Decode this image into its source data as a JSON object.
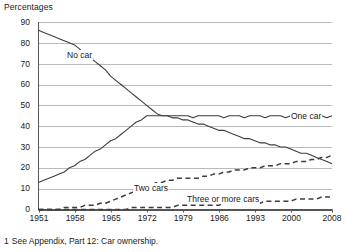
{
  "axis_title": "Percentages",
  "footnote": {
    "number": "1",
    "text": "See Appendix, Part 12: Car ownership."
  },
  "labels": {
    "no_car": "No car",
    "one_car": "One car",
    "two_cars": "Two cars",
    "three_or_more_cars": "Three or more cars"
  },
  "colors": {
    "line": "#3c3c3c",
    "grid": "#b9b9b9",
    "axis": "#555555",
    "text": "#1a1a1a",
    "background": "#ffffff"
  },
  "chart_data": {
    "type": "line",
    "title": "",
    "subtitle": "",
    "xlabel": "",
    "ylabel": "Percentages",
    "ylim": [
      0,
      90
    ],
    "xlim": [
      1951,
      2008
    ],
    "grid": true,
    "legend": "inline-labels",
    "ytick_labels": [
      "0",
      "10",
      "20",
      "30",
      "40",
      "50",
      "60",
      "70",
      "80",
      "90"
    ],
    "ytick_values": [
      0,
      10,
      20,
      30,
      40,
      50,
      60,
      70,
      80,
      90
    ],
    "xtick_labels": [
      "1951",
      "1958",
      "1965",
      "1972",
      "1979",
      "1986",
      "1993",
      "2000",
      "2008"
    ],
    "xtick_values": [
      1951,
      1958,
      1965,
      1972,
      1979,
      1986,
      1993,
      2000,
      2008
    ],
    "x": [
      1951,
      1952,
      1953,
      1954,
      1955,
      1956,
      1957,
      1958,
      1959,
      1960,
      1961,
      1962,
      1963,
      1964,
      1965,
      1966,
      1967,
      1968,
      1969,
      1970,
      1971,
      1972,
      1973,
      1974,
      1975,
      1976,
      1977,
      1978,
      1979,
      1980,
      1981,
      1982,
      1983,
      1984,
      1985,
      1986,
      1987,
      1988,
      1989,
      1990,
      1991,
      1992,
      1993,
      1994,
      1995,
      1996,
      1997,
      1998,
      1999,
      2000,
      2001,
      2002,
      2003,
      2004,
      2005,
      2006,
      2007,
      2008
    ],
    "series": [
      {
        "name": "No car",
        "style": "solid",
        "values": [
          86,
          85,
          84,
          83,
          82,
          81,
          80,
          79,
          77,
          75,
          73,
          71,
          69,
          67,
          64,
          62,
          60,
          58,
          56,
          54,
          52,
          50,
          48,
          46,
          45,
          45,
          44,
          44,
          43,
          43,
          42,
          41,
          41,
          40,
          39,
          38,
          38,
          37,
          36,
          35,
          34,
          34,
          33,
          32,
          32,
          31,
          31,
          30,
          30,
          29,
          28,
          27,
          27,
          26,
          25,
          24,
          23,
          22
        ]
      },
      {
        "name": "One car",
        "style": "solid",
        "values": [
          13,
          14,
          15,
          16,
          17,
          18,
          20,
          21,
          23,
          24,
          26,
          28,
          29,
          31,
          33,
          34,
          36,
          38,
          40,
          42,
          43,
          45,
          45,
          45,
          45,
          45,
          45,
          45,
          45,
          45,
          44,
          45,
          45,
          45,
          45,
          45,
          44,
          45,
          45,
          45,
          44,
          45,
          45,
          45,
          44,
          45,
          45,
          45,
          44,
          45,
          45,
          45,
          44,
          45,
          45,
          45,
          44,
          45
        ]
      },
      {
        "name": "Two cars",
        "style": "dashed",
        "values": [
          0,
          0,
          0,
          0,
          0,
          1,
          1,
          1,
          1,
          2,
          2,
          2,
          3,
          3,
          4,
          5,
          6,
          7,
          8,
          9,
          10,
          11,
          12,
          13,
          13,
          14,
          14,
          15,
          15,
          15,
          15,
          15,
          16,
          16,
          17,
          17,
          18,
          18,
          19,
          19,
          19,
          20,
          20,
          20,
          21,
          21,
          21,
          22,
          22,
          22,
          23,
          23,
          23,
          24,
          24,
          25,
          25,
          26
        ]
      },
      {
        "name": "Three or more cars",
        "style": "dashed",
        "values": [
          0,
          0,
          0,
          0,
          0,
          0,
          0,
          0,
          0,
          0,
          0,
          0,
          0,
          0,
          0,
          0,
          0,
          0,
          1,
          1,
          1,
          1,
          1,
          1,
          1,
          1,
          1,
          2,
          2,
          2,
          2,
          2,
          2,
          2,
          2,
          2,
          3,
          3,
          3,
          3,
          3,
          3,
          3,
          3,
          4,
          4,
          4,
          4,
          4,
          4,
          5,
          5,
          5,
          5,
          5,
          6,
          6,
          6
        ]
      }
    ]
  }
}
